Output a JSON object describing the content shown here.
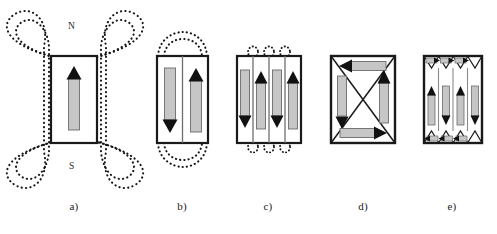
{
  "figure": {
    "background_color": "#ffffff",
    "width": 497,
    "height": 234,
    "colors": {
      "outline": "#1a1a1a",
      "arrow_shaft_fill": "#c6c6c6",
      "arrow_shaft_stroke": "#5a5a5a",
      "arrow_head_fill": "#111111",
      "field_line": "#171717",
      "domain_wall": "#6e6e6e",
      "text": "#1a1a1a"
    }
  },
  "poles": {
    "north_label": "N",
    "south_label": "S"
  },
  "captions": {
    "a": "a)",
    "b": "b)",
    "c": "c)",
    "d": "d)",
    "e": "e)"
  },
  "panels": [
    {
      "id": "a",
      "caption": "a)",
      "domain_count": 1,
      "has_external_field_lines": true,
      "field_line_loops": 4,
      "pole_labels": [
        "N",
        "S"
      ],
      "arrows": [
        {
          "direction": "up",
          "orientation": "vertical"
        }
      ],
      "domain_walls": 0
    },
    {
      "id": "b",
      "caption": "b)",
      "domain_count": 2,
      "has_external_field_lines": true,
      "field_line_loops": 4,
      "pole_labels": [],
      "arrows": [
        {
          "direction": "down",
          "orientation": "vertical"
        },
        {
          "direction": "up",
          "orientation": "vertical"
        }
      ],
      "domain_walls": 1
    },
    {
      "id": "c",
      "caption": "c)",
      "domain_count": 4,
      "has_external_field_lines": true,
      "field_line_loops": 6,
      "pole_labels": [],
      "arrows": [
        {
          "direction": "down",
          "orientation": "vertical"
        },
        {
          "direction": "up",
          "orientation": "vertical"
        },
        {
          "direction": "down",
          "orientation": "vertical"
        },
        {
          "direction": "up",
          "orientation": "vertical"
        }
      ],
      "domain_walls": 3
    },
    {
      "id": "d",
      "caption": "d)",
      "domain_count": 4,
      "has_external_field_lines": false,
      "field_line_loops": 0,
      "pole_labels": [],
      "arrows": [
        {
          "direction": "left",
          "orientation": "horizontal"
        },
        {
          "direction": "down",
          "orientation": "vertical"
        },
        {
          "direction": "up",
          "orientation": "vertical"
        },
        {
          "direction": "right",
          "orientation": "horizontal"
        }
      ],
      "domain_walls": 4,
      "closure_structure": "flux-closure-x"
    },
    {
      "id": "e",
      "caption": "e)",
      "domain_count": 10,
      "has_external_field_lines": false,
      "field_line_loops": 0,
      "pole_labels": [],
      "arrows": [
        {
          "direction": "up",
          "orientation": "vertical"
        },
        {
          "direction": "down",
          "orientation": "vertical"
        },
        {
          "direction": "up",
          "orientation": "vertical"
        },
        {
          "direction": "down",
          "orientation": "vertical"
        },
        {
          "direction": "right",
          "orientation": "horizontal"
        },
        {
          "direction": "right",
          "orientation": "horizontal"
        },
        {
          "direction": "right",
          "orientation": "horizontal"
        },
        {
          "direction": "left",
          "orientation": "horizontal"
        },
        {
          "direction": "left",
          "orientation": "horizontal"
        },
        {
          "direction": "left",
          "orientation": "horizontal"
        }
      ],
      "domain_walls": 3,
      "closure_structure": "multi-flux-closure-triangles",
      "closure_triangles_top": 3,
      "closure_triangles_bottom": 3
    }
  ]
}
